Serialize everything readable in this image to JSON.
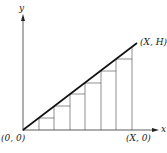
{
  "diagram": {
    "axes": {
      "y_label": "y",
      "x_label": "x",
      "origin_label": "(0, 0)",
      "x_end_label": "(X, 0)",
      "top_label": "(X, H)"
    },
    "strips": 7,
    "colors": {
      "stroke": "#1a1a1a",
      "background": "#ffffff"
    }
  }
}
